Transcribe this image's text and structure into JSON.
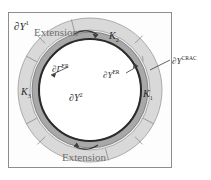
{
  "figure": {
    "background_color": "#ffffff",
    "frame_border_color": "#8d8d8d"
  },
  "colors": {
    "outer_annulus": "#d9d9d9",
    "inner_annulus": "#a8a8a8",
    "core": "#ffffff",
    "outline": "#2a2a2a",
    "divider": "#8a8a8a",
    "label_text": "#2a2a2a",
    "extension_text": "#6f6f6f"
  },
  "labels": {
    "domain_outer": {
      "symbol": "∂Y",
      "sup": "1"
    },
    "domain_inner": {
      "symbol": "∂Y",
      "sup": "2"
    },
    "boundary_er": {
      "symbol": "∂Y",
      "sup": "ER"
    },
    "boundary_gamma_er": {
      "symbol": "∂Γ",
      "sup": "ER"
    },
    "boundary_crac": {
      "symbol": "∂Y",
      "sup": "CRAC"
    },
    "sector_k1": {
      "symbol": "K",
      "sub": "1"
    },
    "sector_k2": {
      "symbol": "K",
      "sub": "2"
    },
    "sector_k3": {
      "symbol": "K",
      "sub": "3"
    },
    "extension_top": "Extension",
    "extension_bottom": "Extension"
  },
  "geometry": {
    "center_x": 90,
    "center_y": 90,
    "outer_radius": 72,
    "mid_radius": 60,
    "inner_band_outer_radius": 58,
    "inner_band_inner_radius": 51,
    "core_radius": 50,
    "sector_divider_angles_deg": [
      28,
      105,
      152,
      208,
      285,
      332
    ]
  }
}
